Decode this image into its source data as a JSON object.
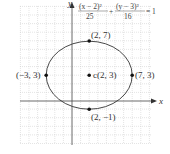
{
  "diagram": {
    "type": "ellipse-graph",
    "equation": {
      "term1_numerator": "(x − 2)²",
      "term1_denominator": "25",
      "plus": "+",
      "term2_numerator": "(y − 3)²",
      "term2_denominator": "16",
      "equals": "= 1"
    },
    "axes": {
      "x_label": "x",
      "y_label": "y"
    },
    "ellipse": {
      "center": [
        2,
        3
      ],
      "a": 5,
      "b": 4,
      "stroke_color": "#333333"
    },
    "points": [
      {
        "name": "top-vertex",
        "label": "(2, 7)",
        "x": 2,
        "y": 7
      },
      {
        "name": "bottom-vertex",
        "label": "(2, −1)",
        "x": 2,
        "y": -1
      },
      {
        "name": "left-vertex",
        "label": "(−3, 3)",
        "x": -3,
        "y": 3
      },
      {
        "name": "right-vertex",
        "label": "(7, 3)",
        "x": 7,
        "y": 3
      },
      {
        "name": "center",
        "label": "c(2, 3)",
        "x": 2,
        "y": 3
      }
    ],
    "grid": {
      "x_range": [
        -6,
        9
      ],
      "y_range": [
        -4,
        11
      ],
      "color": "#cccccc"
    }
  }
}
